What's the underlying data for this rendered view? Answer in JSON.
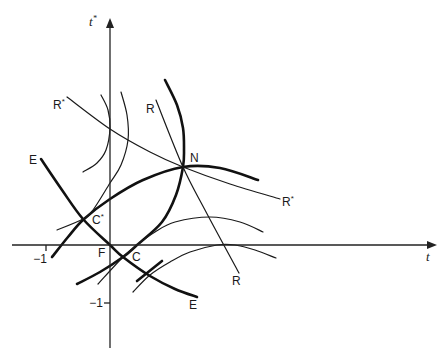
{
  "diagram": {
    "title": "",
    "canvas": {
      "width": 446,
      "height": 362,
      "background": "#ffffff",
      "ink": "#1a1a1a"
    },
    "axes": {
      "x": {
        "label": "t",
        "from": [
          12,
          245
        ],
        "to": [
          437,
          245
        ],
        "ticks": [
          {
            "label": "−1",
            "at": [
              46,
              245
            ],
            "label_pos": [
              40,
              263
            ]
          }
        ]
      },
      "y": {
        "label": "t",
        "label_sup": "*",
        "from": [
          110,
          348
        ],
        "to": [
          110,
          18
        ],
        "ticks": [
          {
            "label": "−1",
            "at": [
              110,
              303
            ],
            "label_pos": [
              103,
              307
            ]
          }
        ]
      },
      "x_label_pos": [
        426,
        261
      ],
      "y_label_pos": [
        89,
        26
      ]
    },
    "labels": [
      {
        "id": "point-n",
        "text": "N",
        "sup": "",
        "pos": [
          190,
          162
        ]
      },
      {
        "id": "point-c-star",
        "text": "C",
        "sup": "*",
        "pos": [
          92,
          224
        ]
      },
      {
        "id": "point-c",
        "text": "C",
        "sup": "",
        "pos": [
          132,
          261
        ]
      },
      {
        "id": "point-f",
        "text": "F",
        "sup": "",
        "pos": [
          98,
          257
        ]
      },
      {
        "id": "curve-r-star-left",
        "text": "R",
        "sup": "*",
        "pos": [
          53,
          109
        ]
      },
      {
        "id": "curve-r-star-right",
        "text": "R",
        "sup": "*",
        "pos": [
          282,
          206
        ]
      },
      {
        "id": "curve-r-top",
        "text": "R",
        "sup": "",
        "pos": [
          146,
          113
        ]
      },
      {
        "id": "curve-r-bottom",
        "text": "R",
        "sup": "",
        "pos": [
          232,
          285
        ]
      },
      {
        "id": "curve-e-left",
        "text": "E",
        "sup": "",
        "pos": [
          29,
          164
        ]
      },
      {
        "id": "curve-e-right",
        "text": "E",
        "sup": "",
        "pos": [
          189,
          309
        ]
      }
    ],
    "curves": [
      {
        "id": "curve-e",
        "weight": "thick",
        "points": [
          [
            41,
            159
          ],
          [
            62,
            190
          ],
          [
            83,
            219
          ],
          [
            110,
            245
          ],
          [
            123,
            257
          ],
          [
            150,
            276
          ],
          [
            175,
            289
          ],
          [
            197,
            297
          ]
        ]
      },
      {
        "id": "curve-c-star-n",
        "weight": "thick",
        "points": [
          [
            52,
            257
          ],
          [
            68,
            237
          ],
          [
            84,
            219
          ],
          [
            110,
            199
          ],
          [
            143,
            180
          ],
          [
            183,
            167
          ],
          [
            220,
            168
          ],
          [
            258,
            180
          ]
        ]
      },
      {
        "id": "curve-n-c",
        "weight": "thick",
        "points": [
          [
            165,
            80
          ],
          [
            177,
            105
          ],
          [
            183,
            128
          ],
          [
            184,
            150
          ],
          [
            183,
            167
          ],
          [
            176,
            195
          ],
          [
            162,
            222
          ],
          [
            137,
            245
          ],
          [
            123,
            257
          ],
          [
            100,
            272
          ],
          [
            77,
            284
          ]
        ]
      },
      {
        "id": "curve-short-segment",
        "weight": "thick",
        "points": [
          [
            137,
            281
          ],
          [
            162,
            261
          ]
        ]
      },
      {
        "id": "curve-r-star",
        "weight": "thin",
        "points": [
          [
            67,
            97
          ],
          [
            110,
            129
          ],
          [
            150,
            152
          ],
          [
            183,
            167
          ],
          [
            230,
            184
          ],
          [
            280,
            199
          ]
        ]
      },
      {
        "id": "curve-r",
        "weight": "thin",
        "points": [
          [
            156,
            100
          ],
          [
            183,
            167
          ],
          [
            205,
            210
          ],
          [
            239,
            273
          ]
        ]
      },
      {
        "id": "arc-upper-left-1",
        "weight": "thin",
        "points": [
          [
            101,
            95
          ],
          [
            108,
            110
          ],
          [
            110,
            128
          ],
          [
            106,
            150
          ],
          [
            97,
            163
          ],
          [
            83,
            172
          ]
        ]
      },
      {
        "id": "arc-upper-left-2",
        "weight": "thin",
        "points": [
          [
            121,
            92
          ],
          [
            127,
            115
          ],
          [
            128,
            140
          ],
          [
            121,
            165
          ],
          [
            110,
            183
          ],
          [
            93,
            210
          ],
          [
            83,
            219
          ],
          [
            57,
            230
          ]
        ]
      },
      {
        "id": "arc-right-upper",
        "weight": "thin",
        "points": [
          [
            98,
            284
          ],
          [
            123,
            257
          ],
          [
            137,
            245
          ],
          [
            155,
            232
          ],
          [
            175,
            222
          ],
          [
            210,
            217
          ],
          [
            240,
            222
          ],
          [
            263,
            232
          ]
        ]
      },
      {
        "id": "arc-right-lower",
        "weight": "thin",
        "points": [
          [
            133,
            292
          ],
          [
            150,
            275
          ],
          [
            170,
            262
          ],
          [
            190,
            252
          ],
          [
            217,
            245
          ],
          [
            235,
            245
          ],
          [
            255,
            250
          ],
          [
            276,
            258
          ]
        ]
      }
    ]
  }
}
